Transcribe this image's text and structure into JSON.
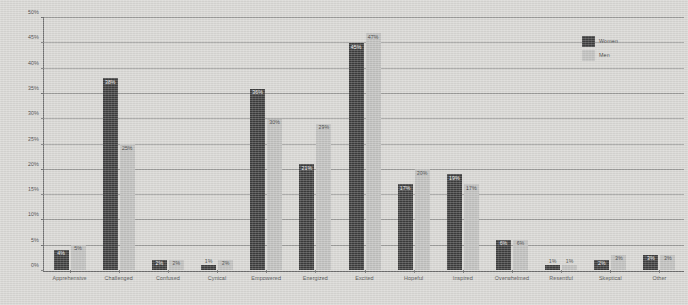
{
  "chart_data": {
    "type": "bar",
    "title": "",
    "xlabel": "",
    "ylabel": "",
    "ylim": [
      0,
      50
    ],
    "ytick_labels": [
      "0%",
      "5%",
      "10%",
      "15%",
      "20%",
      "25%",
      "30%",
      "35%",
      "40%",
      "45%",
      "50%"
    ],
    "ytick_values": [
      0,
      5,
      10,
      15,
      20,
      25,
      30,
      35,
      40,
      45,
      50
    ],
    "grid": true,
    "legend_position": "top-right",
    "value_suffix": "%",
    "categories": [
      "Apprehensive",
      "Challenged",
      "Confused",
      "Cynical",
      "Empowered",
      "Energized",
      "Excited",
      "Hopeful",
      "Inspired",
      "Overwhelmed",
      "Resentful",
      "Skeptical",
      "Other"
    ],
    "series": [
      {
        "name": "Women",
        "color": "#3c3c3c",
        "values": [
          4,
          38,
          2,
          1,
          36,
          21,
          45,
          17,
          19,
          6,
          1,
          2,
          3
        ],
        "labels": [
          "4%",
          "38%",
          "2%",
          "1%",
          "36%",
          "21%",
          "45%",
          "17%",
          "19%",
          "6%",
          "1%",
          "2%",
          "3%"
        ]
      },
      {
        "name": "Men",
        "color": "#bfbfbd",
        "values": [
          5,
          25,
          2,
          2,
          30,
          29,
          47,
          20,
          17,
          6,
          1,
          3,
          3
        ],
        "labels": [
          "5%",
          "25%",
          "2%",
          "2%",
          "30%",
          "29%",
          "47%",
          "20%",
          "17%",
          "6%",
          "1%",
          "3%",
          "3%"
        ]
      }
    ]
  },
  "legend": {
    "items": [
      {
        "label": "Women",
        "swatch": "women-swatch"
      },
      {
        "label": "Men",
        "swatch": "men-swatch"
      }
    ]
  }
}
